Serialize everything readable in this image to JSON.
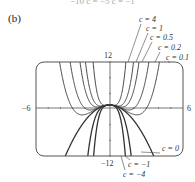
{
  "panel_label": "(b)",
  "top_fragment": "−10   c = −5   c = −1",
  "chart_data": {
    "type": "line",
    "title": "",
    "function": "f(x) = c·x^4 − x^2 + 1",
    "xlim": [
      -6,
      6
    ],
    "ylim": [
      -12,
      12
    ],
    "x_ticks_labels": {
      "left": "−6",
      "right": "6"
    },
    "y_ticks_labels": {
      "top": "12",
      "bottom": "−12"
    },
    "grid": false,
    "series": [
      {
        "name": "c = 4",
        "c": 4
      },
      {
        "name": "c = 1",
        "c": 1
      },
      {
        "name": "c = 0.5",
        "c": 0.5
      },
      {
        "name": "c = 0.2",
        "c": 0.2
      },
      {
        "name": "c = 0.1",
        "c": 0.1
      },
      {
        "name": "c = 0",
        "c": 0
      },
      {
        "name": "c = −1",
        "c": -1
      },
      {
        "name": "c = −4",
        "c": -4
      }
    ],
    "annotations": [
      "c = 4",
      "c = 1",
      "c = 0.5",
      "c = 0.2",
      "c = 0.1",
      "c = 0",
      "c = −1",
      "c = −4"
    ]
  }
}
